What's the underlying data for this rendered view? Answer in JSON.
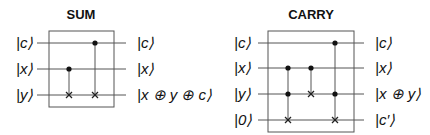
{
  "circuits": [
    {
      "id": "sum",
      "title": "SUM",
      "inputs": [
        "|c⟩",
        "|x⟩",
        "|y⟩"
      ],
      "outputs": [
        "|c⟩",
        "|x⟩",
        "|x ⊕ y ⊕ c⟩"
      ],
      "gates": [
        {
          "type": "CNOT",
          "controls": [
            "x"
          ],
          "target": "y"
        },
        {
          "type": "CNOT",
          "controls": [
            "c"
          ],
          "target": "y"
        }
      ]
    },
    {
      "id": "carry",
      "title": "CARRY",
      "inputs": [
        "|c⟩",
        "|x⟩",
        "|y⟩",
        "|0⟩"
      ],
      "outputs": [
        "|c⟩",
        "|x⟩",
        "|x ⊕ y⟩",
        "|c′⟩"
      ],
      "gates": [
        {
          "type": "Toffoli",
          "controls": [
            "x",
            "y"
          ],
          "target": "0"
        },
        {
          "type": "CNOT",
          "controls": [
            "x"
          ],
          "target": "y"
        },
        {
          "type": "Toffoli",
          "controls": [
            "c",
            "y"
          ],
          "target": "0"
        }
      ]
    }
  ],
  "colors": {
    "line": "#555555",
    "text": "#111111",
    "background": "#ffffff"
  }
}
